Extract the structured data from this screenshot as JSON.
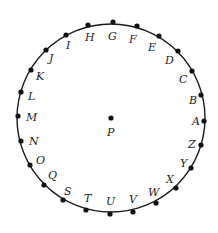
{
  "diagram": {
    "circle": {
      "cx": 111,
      "cy": 118,
      "r": 94,
      "stroke": "#1a1a1a"
    },
    "center_point": {
      "label": "P",
      "x": 111,
      "y": 118,
      "label_x": 107,
      "label_y": 136
    },
    "dot_color": "#111111",
    "points": [
      {
        "label": "G",
        "x": 113,
        "y": 22,
        "lx": 108,
        "ly": 40
      },
      {
        "label": "F",
        "x": 137,
        "y": 26,
        "lx": 129,
        "ly": 43
      },
      {
        "label": "E",
        "x": 159,
        "y": 36,
        "lx": 148,
        "ly": 51
      },
      {
        "label": "D",
        "x": 178,
        "y": 51,
        "lx": 165,
        "ly": 64
      },
      {
        "label": "C",
        "x": 192,
        "y": 71,
        "lx": 179,
        "ly": 83
      },
      {
        "label": "B",
        "x": 201,
        "y": 95,
        "lx": 189,
        "ly": 104
      },
      {
        "label": "A",
        "x": 204,
        "y": 121,
        "lx": 192,
        "ly": 125
      },
      {
        "label": "Z",
        "x": 201,
        "y": 145,
        "lx": 188,
        "ly": 148
      },
      {
        "label": "Y",
        "x": 191,
        "y": 168,
        "lx": 180,
        "ly": 167
      },
      {
        "label": "X",
        "x": 176,
        "y": 188,
        "lx": 166,
        "ly": 183
      },
      {
        "label": "W",
        "x": 156,
        "y": 203,
        "lx": 148,
        "ly": 196
      },
      {
        "label": "V",
        "x": 133,
        "y": 212,
        "lx": 129,
        "ly": 203
      },
      {
        "label": "U",
        "x": 110,
        "y": 214,
        "lx": 106,
        "ly": 205
      },
      {
        "label": "T",
        "x": 86,
        "y": 210,
        "lx": 84,
        "ly": 202
      },
      {
        "label": "S",
        "x": 63,
        "y": 200,
        "lx": 64,
        "ly": 195
      },
      {
        "label": "Q",
        "x": 44,
        "y": 185,
        "lx": 48,
        "ly": 179
      },
      {
        "label": "O",
        "x": 30,
        "y": 165,
        "lx": 36,
        "ly": 164
      },
      {
        "label": "N",
        "x": 21,
        "y": 141,
        "lx": 29,
        "ly": 145
      },
      {
        "label": "M",
        "x": 18,
        "y": 116,
        "lx": 26,
        "ly": 121
      },
      {
        "label": "L",
        "x": 21,
        "y": 92,
        "lx": 28,
        "ly": 100
      },
      {
        "label": "K",
        "x": 31,
        "y": 70,
        "lx": 36,
        "ly": 80
      },
      {
        "label": "J",
        "x": 46,
        "y": 50,
        "lx": 49,
        "ly": 62
      },
      {
        "label": "I",
        "x": 66,
        "y": 35,
        "lx": 66,
        "ly": 49
      },
      {
        "label": "H",
        "x": 88,
        "y": 25,
        "lx": 85,
        "ly": 41
      }
    ]
  }
}
